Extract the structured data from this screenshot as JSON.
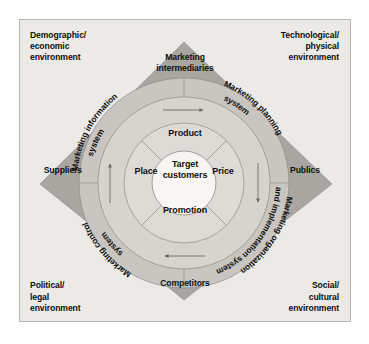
{
  "figure": {
    "center": {
      "label": "Target\ncustomers"
    },
    "marketing_mix": {
      "name": "4 Ps",
      "items": [
        {
          "key": "product",
          "label": "Product",
          "position": "top"
        },
        {
          "key": "price",
          "label": "Price",
          "position": "right"
        },
        {
          "key": "promotion",
          "label": "Promotion",
          "position": "bottom"
        },
        {
          "key": "place",
          "label": "Place",
          "position": "left"
        }
      ]
    },
    "marketing_systems": {
      "name": "Marketing systems ring",
      "flow_direction": "clockwise",
      "items": [
        {
          "key": "marketing-information-system",
          "label": "Marketing information system",
          "lines": [
            "Marketing information",
            "system"
          ],
          "quadrant": "upper-left"
        },
        {
          "key": "marketing-planning-system",
          "label": "Marketing planning system",
          "lines": [
            "Marketing planning",
            "system"
          ],
          "quadrant": "upper-right"
        },
        {
          "key": "marketing-organization-and-implementation-system",
          "label": "Marketing organization and implementation system",
          "lines": [
            "Marketing organization",
            "and implementation system"
          ],
          "quadrant": "lower-right"
        },
        {
          "key": "marketing-control-system",
          "label": "Marketing control system",
          "lines": [
            "Marketing control",
            "system"
          ],
          "quadrant": "lower-left"
        }
      ],
      "arrows": [
        {
          "key": "arrow-top",
          "direction": "right"
        },
        {
          "key": "arrow-right",
          "direction": "down"
        },
        {
          "key": "arrow-bottom",
          "direction": "left"
        },
        {
          "key": "arrow-left",
          "direction": "up"
        }
      ]
    },
    "actors": [
      {
        "key": "marketing-intermediaries",
        "label": "Marketing\nintermediaries",
        "position": "top"
      },
      {
        "key": "publics",
        "label": "Publics",
        "position": "right"
      },
      {
        "key": "competitors",
        "label": "Competitors",
        "position": "bottom"
      },
      {
        "key": "suppliers",
        "label": "Suppliers",
        "position": "left"
      }
    ],
    "environments": [
      {
        "key": "demographic-economic",
        "label": "Demographic/\neconomic\nenvironment",
        "position": "top-left"
      },
      {
        "key": "technological-physical",
        "label": "Technological/\nphysical\nenvironment",
        "position": "top-right"
      },
      {
        "key": "political-legal",
        "label": "Political/\nlegal\nenvironment",
        "position": "bottom-left"
      },
      {
        "key": "social-cultural",
        "label": "Social/\ncultural\nenvironment",
        "position": "bottom-right"
      }
    ],
    "colors": {
      "page_background": "#ffffff",
      "frame_background": "#eceae6",
      "frame_border": "#b9b6b0",
      "diamond_fill": "#a9a6a1",
      "outer_ring_fill": "#c9c6c1",
      "inner_ring_fill": "#dedbd6",
      "center_fill": "#f7f6f3",
      "line": "#6e6b66",
      "text": "#100f0d"
    }
  }
}
